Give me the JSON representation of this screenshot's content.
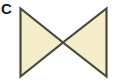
{
  "figure": {
    "label": "C",
    "shape_name": "bowtie-hourglass",
    "canvas": {
      "width": 114,
      "height": 82
    },
    "colors": {
      "background": "#ffffff",
      "fill": "#f5ecca",
      "stroke": "#4a4a3c",
      "label": "#1a1a1a"
    },
    "stroke_width": 2.2,
    "shapes": [
      {
        "name": "left-triangle",
        "points": "20.5,8.5 20.5,76.5 63,42.5",
        "orientation": "points-right"
      },
      {
        "name": "right-triangle",
        "points": "106.5,8.5 106.5,76.5 63,42.5",
        "orientation": "points-left"
      }
    ],
    "apex": {
      "x": 63,
      "y": 42.5
    }
  }
}
